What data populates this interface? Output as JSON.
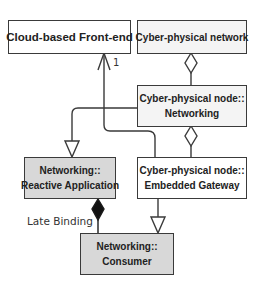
{
  "diagram": {
    "type": "UML class diagram",
    "nodes": [
      {
        "id": "cloud-frontend",
        "lines": [
          "Cloud-based Front-end"
        ],
        "fill": "#ffffff"
      },
      {
        "id": "cps-network",
        "lines": [
          "Cyber-physical network"
        ],
        "fill": "#f4f4f4"
      },
      {
        "id": "cps-node-networking",
        "lines": [
          "Cyber-physical node::",
          "Networking"
        ],
        "fill": "#f4f4f4"
      },
      {
        "id": "cps-node-embedded-gateway",
        "lines": [
          "Cyber-physical node::",
          "Embedded Gateway"
        ],
        "fill": "#ffffff"
      },
      {
        "id": "networking-reactive-application",
        "lines": [
          "Networking::",
          "Reactive Application"
        ],
        "fill": "#d8d8d8"
      },
      {
        "id": "networking-consumer",
        "lines": [
          "Networking::",
          "Consumer"
        ],
        "fill": "#d8d8d8"
      }
    ],
    "edges": [
      {
        "from": "cps-node-networking",
        "to": "cps-network",
        "kind": "aggregation"
      },
      {
        "from": "cps-node-embedded-gateway",
        "to": "cps-node-networking",
        "kind": "aggregation"
      },
      {
        "from": "cps-node-networking",
        "to": "networking-reactive-application",
        "kind": "generalization"
      },
      {
        "from": "cps-node-embedded-gateway",
        "to": "cloud-frontend",
        "kind": "association",
        "multiplicity": "1"
      },
      {
        "from": "networking-consumer",
        "to": "networking-reactive-application",
        "kind": "composition",
        "label": "Late Binding"
      },
      {
        "from": "cps-node-embedded-gateway",
        "to": "networking-consumer",
        "kind": "generalization"
      }
    ],
    "labels": {
      "multiplicity": "1",
      "late_binding": "Late Binding"
    }
  }
}
